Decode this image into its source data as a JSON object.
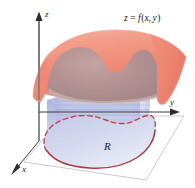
{
  "figure": {
    "width": 195,
    "height": 188,
    "background_color": "#ffffff"
  },
  "axes": {
    "z": {
      "label": "z",
      "direction": "up",
      "arrow": true,
      "color": "#58585a"
    },
    "y": {
      "label": "y",
      "direction": "right",
      "arrow": true,
      "color": "#3a3a3c"
    },
    "x": {
      "label": "x",
      "direction": "down-left",
      "arrow": true,
      "color": "#3a3a3c"
    }
  },
  "labels": {
    "surface_equation": "z = f(x, y)",
    "surface_equation_parts": {
      "lhs": "z",
      "eq": "=",
      "fn": "f",
      "open": "(",
      "arg1": "x",
      "comma": ",",
      "arg2": "y",
      "close": ")"
    },
    "region": "R"
  },
  "surface": {
    "name": "z = f(x, y)",
    "outer_color": "#ef8876",
    "outer_color_light": "#f7b7a8",
    "outer_edge_color": "#e8735f",
    "inner_shadow_color": "#a98a8d",
    "inner_highlight_color": "#c9a7a6",
    "description": "curved sheet draping over the region, darker where it lies directly above R"
  },
  "solid": {
    "name": "cylindrical solid over R",
    "side_color_top": "#b9bfe3",
    "side_color_bottom": "#e3e6f5",
    "side_line_color": "#8f96bf",
    "description": "vertical walls rising from the boundary of R up to the surface"
  },
  "region_R": {
    "name": "R",
    "fill_start": "#ccd1ec",
    "fill_end": "#e8eaf7",
    "front_edge_color": "#b5393a",
    "back_edge_color": "#c0474a",
    "back_edge_style": "dashed",
    "front_edge_style": "solid",
    "description": "bean shaped plane region in the xy-plane"
  },
  "plane": {
    "name": "xy-plane",
    "edge_color": "#b9b9b9",
    "fill_color": "#ffffff"
  }
}
